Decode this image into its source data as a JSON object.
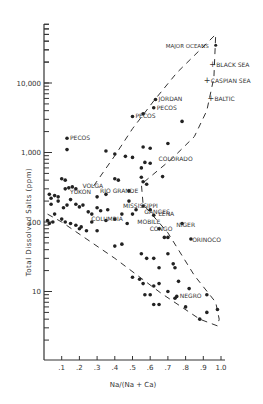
{
  "chart_data": {
    "type": "scatter",
    "title": "",
    "xlabel": "Na/(Na + Ca)",
    "ylabel": "Total Dissolved Salts (ppm)",
    "xlim": [
      0,
      1.0
    ],
    "ylim": [
      3,
      70000
    ],
    "yscale": "log",
    "xticks": [
      ".1",
      ".2",
      ".3",
      ".4",
      ".5",
      ".6",
      ".7",
      ".8",
      ".9",
      "1.0"
    ],
    "yticks": [
      {
        "label": "10",
        "value": 10
      },
      {
        "label": "100",
        "value": 100
      },
      {
        "label": "1,000",
        "value": 1000
      },
      {
        "label": "10,000",
        "value": 10000
      }
    ],
    "grid": false,
    "legend": null,
    "labeled_points": [
      {
        "name": "Major Oceans",
        "x": 0.97,
        "y": 35000
      },
      {
        "name": "Black Sea",
        "x": 0.95,
        "y": 19000
      },
      {
        "name": "Caspian Sea",
        "x": 0.92,
        "y": 11000
      },
      {
        "name": "Baltic",
        "x": 0.94,
        "y": 6000
      },
      {
        "name": "Jordan",
        "x": 0.63,
        "y": 5800
      },
      {
        "name": "Pecos",
        "x": 0.13,
        "y": 1600
      },
      {
        "name": "Pecos",
        "x": 0.5,
        "y": 3300
      },
      {
        "name": "Pecos",
        "x": 0.62,
        "y": 4400
      },
      {
        "name": "Colorado",
        "x": 0.63,
        "y": 800
      },
      {
        "name": "Rio Grande",
        "x": 0.3,
        "y": 280
      },
      {
        "name": "Volga",
        "x": 0.2,
        "y": 330
      },
      {
        "name": "Yukon",
        "x": 0.13,
        "y": 270
      },
      {
        "name": "Columbia",
        "x": 0.25,
        "y": 110
      },
      {
        "name": "Mississippi",
        "x": 0.43,
        "y": 170
      },
      {
        "name": "Ganges",
        "x": 0.55,
        "y": 140
      },
      {
        "name": "Lena",
        "x": 0.63,
        "y": 130
      },
      {
        "name": "Mobile",
        "x": 0.51,
        "y": 100
      },
      {
        "name": "Congo",
        "x": 0.58,
        "y": 78
      },
      {
        "name": "Niger",
        "x": 0.73,
        "y": 90
      },
      {
        "name": "Orinoco",
        "x": 0.82,
        "y": 55
      },
      {
        "name": "Negro",
        "x": 0.75,
        "y": 8.5
      }
    ],
    "points": [
      [
        0.13,
        1600
      ],
      [
        0.13,
        1100
      ],
      [
        0.5,
        3300
      ],
      [
        0.56,
        3600
      ],
      [
        0.62,
        4400
      ],
      [
        0.63,
        5800
      ],
      [
        0.35,
        1050
      ],
      [
        0.4,
        950
      ],
      [
        0.46,
        880
      ],
      [
        0.56,
        1200
      ],
      [
        0.6,
        1150
      ],
      [
        0.7,
        1350
      ],
      [
        0.78,
        2800
      ],
      [
        0.5,
        850
      ],
      [
        0.57,
        720
      ],
      [
        0.6,
        700
      ],
      [
        0.67,
        450
      ],
      [
        0.55,
        600
      ],
      [
        0.55,
        440
      ],
      [
        0.56,
        380
      ],
      [
        0.58,
        350
      ],
      [
        0.3,
        230
      ],
      [
        0.35,
        250
      ],
      [
        0.4,
        420
      ],
      [
        0.42,
        400
      ],
      [
        0.48,
        280
      ],
      [
        0.48,
        200
      ],
      [
        0.03,
        250
      ],
      [
        0.04,
        220
      ],
      [
        0.06,
        240
      ],
      [
        0.08,
        230
      ],
      [
        0.12,
        300
      ],
      [
        0.14,
        310
      ],
      [
        0.16,
        320
      ],
      [
        0.18,
        300
      ],
      [
        0.1,
        420
      ],
      [
        0.12,
        400
      ],
      [
        0.04,
        180
      ],
      [
        0.08,
        200
      ],
      [
        0.11,
        160
      ],
      [
        0.13,
        175
      ],
      [
        0.15,
        210
      ],
      [
        0.18,
        180
      ],
      [
        0.2,
        165
      ],
      [
        0.22,
        175
      ],
      [
        0.25,
        140
      ],
      [
        0.27,
        130
      ],
      [
        0.3,
        160
      ],
      [
        0.32,
        145
      ],
      [
        0.36,
        150
      ],
      [
        0.02,
        105
      ],
      [
        0.03,
        95
      ],
      [
        0.05,
        100
      ],
      [
        0.06,
        130
      ],
      [
        0.1,
        110
      ],
      [
        0.12,
        100
      ],
      [
        0.15,
        95
      ],
      [
        0.18,
        90
      ],
      [
        0.2,
        80
      ],
      [
        0.21,
        85
      ],
      [
        0.24,
        75
      ],
      [
        0.27,
        100
      ],
      [
        0.3,
        75
      ],
      [
        0.35,
        105
      ],
      [
        0.4,
        110
      ],
      [
        0.44,
        130
      ],
      [
        0.47,
        95
      ],
      [
        0.5,
        130
      ],
      [
        0.52,
        150
      ],
      [
        0.56,
        170
      ],
      [
        0.6,
        150
      ],
      [
        0.62,
        125
      ],
      [
        0.65,
        80
      ],
      [
        0.7,
        60
      ],
      [
        0.78,
        95
      ],
      [
        0.83,
        57
      ],
      [
        0.68,
        60
      ],
      [
        0.4,
        45
      ],
      [
        0.44,
        48
      ],
      [
        0.55,
        35
      ],
      [
        0.58,
        30
      ],
      [
        0.62,
        30
      ],
      [
        0.7,
        35
      ],
      [
        0.73,
        25
      ],
      [
        0.74,
        22
      ],
      [
        0.65,
        22
      ],
      [
        0.5,
        16
      ],
      [
        0.54,
        15
      ],
      [
        0.56,
        13
      ],
      [
        0.62,
        12
      ],
      [
        0.65,
        13
      ],
      [
        0.76,
        14
      ],
      [
        0.82,
        11
      ],
      [
        0.7,
        10
      ],
      [
        0.6,
        9
      ],
      [
        0.57,
        9
      ],
      [
        0.74,
        8
      ],
      [
        0.75,
        8.5
      ],
      [
        0.8,
        6
      ],
      [
        0.88,
        4
      ],
      [
        0.92,
        9
      ],
      [
        0.92,
        5
      ],
      [
        0.98,
        5.5
      ],
      [
        0.62,
        6.5
      ],
      [
        0.65,
        6.5
      ]
    ],
    "envelope": {
      "outer_left": [
        [
          0.28,
          330
        ],
        [
          0.4,
          900
        ],
        [
          0.5,
          2200
        ],
        [
          0.62,
          5500
        ],
        [
          0.75,
          14000
        ],
        [
          0.97,
          50000
        ]
      ],
      "outer_right": [
        [
          0.97,
          50000
        ],
        [
          0.96,
          12000
        ],
        [
          0.92,
          4000
        ],
        [
          0.85,
          1700
        ],
        [
          0.72,
          800
        ],
        [
          0.55,
          350
        ],
        [
          0.56,
          180
        ],
        [
          0.7,
          70
        ],
        [
          0.85,
          17
        ],
        [
          0.97,
          7
        ],
        [
          0.99,
          4
        ],
        [
          0.98,
          3.2
        ],
        [
          0.88,
          4
        ],
        [
          0.66,
          9.5
        ],
        [
          0.4,
          30
        ],
        [
          0.1,
          100
        ],
        [
          0.02,
          130
        ]
      ]
    }
  }
}
